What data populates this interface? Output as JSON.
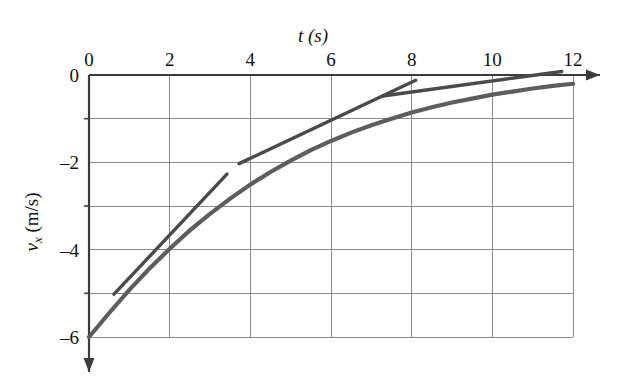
{
  "figure": {
    "title_top": "t (s)",
    "ylabel": "v",
    "ylabel_sub": "x",
    "ylabel_unit": " (m/s)",
    "background_color": "#ffffff",
    "curve_color": "#5d5d5d",
    "tangent_color": "#4a4a4a",
    "grid_color": "#8a8a8a",
    "axis_color": "#3b3b3b"
  },
  "chart_data": {
    "type": "line",
    "title": "t (s)",
    "xlabel": "t (s)",
    "ylabel": "v_x (m/s)",
    "xlim": [
      0,
      12
    ],
    "ylim": [
      -6,
      0
    ],
    "grid": true,
    "legend": "none",
    "x_ticks": [
      0,
      2,
      4,
      6,
      8,
      10,
      12
    ],
    "x_tick_labels": [
      "0",
      "2",
      "4",
      "6",
      "8",
      "10",
      "12"
    ],
    "y_ticks": [
      0,
      -2,
      -4,
      -6
    ],
    "y_tick_labels": [
      "0",
      "-2",
      "-4",
      "-6"
    ],
    "y_minor_gridlines": [
      -1,
      -3,
      -5
    ],
    "x_axis_position": "top",
    "y_axis_direction": "downward",
    "series": [
      {
        "name": "v_x(t)",
        "description": "Velocity curve rising from -6 m/s toward 0 m/s, exponential-like approach",
        "x": [
          0,
          0.5,
          1,
          1.5,
          2,
          2.5,
          3,
          3.5,
          4,
          4.5,
          5,
          5.5,
          6,
          6.5,
          7,
          7.5,
          8,
          8.5,
          9,
          9.5,
          10,
          10.5,
          11,
          11.5,
          12
        ],
        "y": [
          -6.0,
          -5.45,
          -4.92,
          -4.43,
          -3.98,
          -3.56,
          -3.18,
          -2.83,
          -2.51,
          -2.22,
          -1.96,
          -1.72,
          -1.51,
          -1.32,
          -1.15,
          -1.0,
          -0.86,
          -0.74,
          -0.63,
          -0.54,
          -0.45,
          -0.38,
          -0.31,
          -0.25,
          -0.2
        ]
      }
    ],
    "annotations": [
      {
        "name": "tangent-line-1",
        "description": "Tangent to the curve near t = 2 s",
        "x0": 0.62,
        "y0": -5.02,
        "x1": 3.42,
        "y1": -2.27
      },
      {
        "name": "tangent-line-2",
        "description": "Tangent to the curve near t = 5 s",
        "x0": 3.72,
        "y0": -2.03,
        "x1": 8.1,
        "y1": -0.12
      },
      {
        "name": "tangent-line-3",
        "description": "Tangent to the curve near t = 9 s",
        "x0": 7.28,
        "y0": -0.48,
        "x1": 11.72,
        "y1": 0.08
      }
    ]
  }
}
